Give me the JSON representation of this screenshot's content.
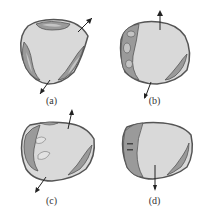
{
  "figure": {
    "panels": [
      {
        "id": "a",
        "label": "(a)"
      },
      {
        "id": "b",
        "label": "(b)"
      },
      {
        "id": "c",
        "label": "(c)"
      },
      {
        "id": "d",
        "label": "(d)"
      }
    ]
  },
  "colors": {
    "cell_fill": "#d9d9d9",
    "outline": "#555555",
    "organelle_fill": "#9a9a9a",
    "organelle_inner": "#c4c4c4",
    "arrow": "#222222"
  }
}
